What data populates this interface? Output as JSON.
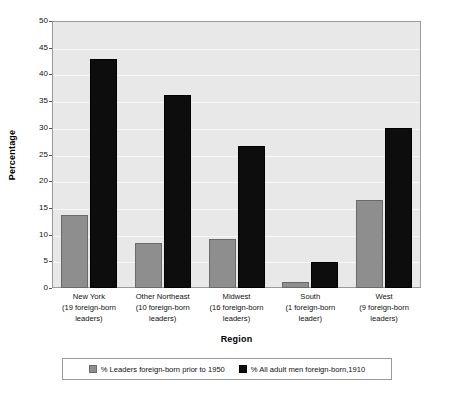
{
  "chart_data": {
    "type": "bar",
    "title": "",
    "xlabel": "Region",
    "ylabel": "Percentage",
    "ylim": [
      0,
      50
    ],
    "ytick_values": [
      0,
      5,
      10,
      15,
      20,
      25,
      30,
      35,
      40,
      45,
      50
    ],
    "ytick_labels": [
      "0",
      "5",
      "10",
      "15",
      "20",
      "25",
      "30",
      "35",
      "40",
      "45",
      "50"
    ],
    "grid": true,
    "legend_position": "bottom",
    "categories": [
      "New York\n(19 foreign-born\nleaders)",
      "Other Northeast\n(10 foreign-born\nleaders)",
      "Midwest\n(16 foreign-born\nleaders)",
      "South\n(1 foreign-born\nleader)",
      "West\n(9 foreign-born\nleaders)"
    ],
    "category_lines": [
      [
        "New York",
        "(19 foreign-born",
        "leaders)"
      ],
      [
        "Other Northeast",
        "(10 foreign-born",
        "leaders)"
      ],
      [
        "Midwest",
        "(16 foreign-born",
        "leaders)"
      ],
      [
        "South",
        "(1 foreign-born",
        "leader)"
      ],
      [
        "West",
        "(9 foreign-born",
        "leaders)"
      ]
    ],
    "series": [
      {
        "name": "% Leaders foreign-born prior to 1950",
        "color": "#8e8e8e",
        "values": [
          13.7,
          8.5,
          9.1,
          1.1,
          16.4
        ]
      },
      {
        "name": "% All adult men foreign-born,1910",
        "color": "#0d0d0d",
        "values": [
          42.9,
          36.1,
          26.6,
          4.9,
          30.0
        ]
      }
    ]
  },
  "legend": {
    "items": [
      {
        "label": "% Leaders foreign-born prior to 1950",
        "swatch": "s0"
      },
      {
        "label": "% All adult men foreign-born,1910",
        "swatch": "s1"
      }
    ]
  },
  "axes": {
    "y_title": "Percentage",
    "x_title": "Region"
  },
  "colors": {
    "plot_background": "#e8e8e8",
    "gridline": "#f7f7f7",
    "frame": "#9a9a9a",
    "series_leaders": "#8e8e8e",
    "series_all_men": "#0d0d0d"
  }
}
